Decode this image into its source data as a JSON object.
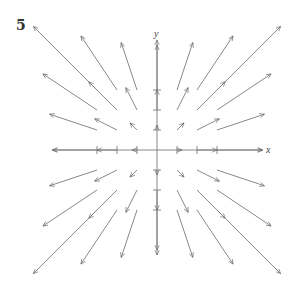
{
  "problem_number": "5",
  "axes": {
    "x_label": "x",
    "y_label": "y",
    "origin_px": [
      157,
      150
    ],
    "unit_px": 20,
    "x_range": [
      -5.2,
      5.3
    ],
    "y_range": [
      -5.0,
      5.5
    ],
    "ticks": [
      -3,
      -2,
      -1,
      1,
      2,
      3
    ]
  },
  "vector_field": {
    "description": "Radial outward field, arrows at integer grid points, length proportional to r * (x, y)",
    "scale_px": 5,
    "grid": [
      -3,
      -2,
      -1,
      0,
      1,
      2,
      3
    ],
    "line_color": "#7a7a7a"
  }
}
